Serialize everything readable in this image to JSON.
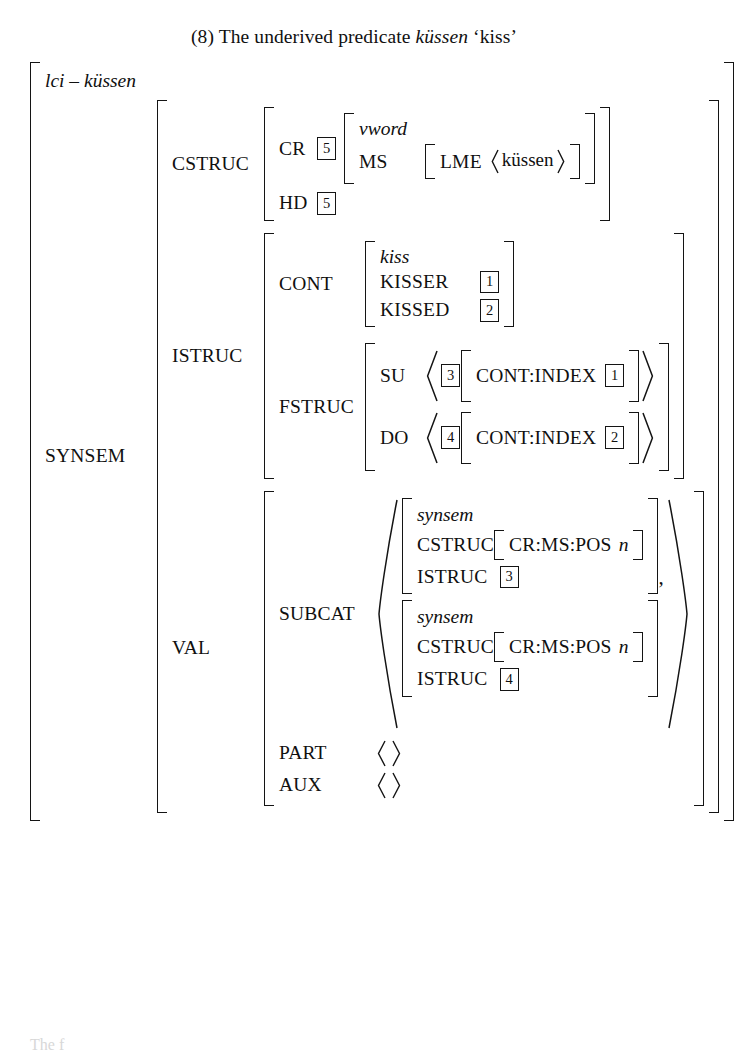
{
  "caption": {
    "number": "(8)",
    "text_before": "The underived predicate",
    "italic_word": "küssen",
    "gloss": "‘kiss’"
  },
  "avm": {
    "root_type": "lci – küssen",
    "synsem_label": "SYNSEM",
    "cstruc": {
      "label": "CSTRUC",
      "cr_label": "CR",
      "cr_tag": "5",
      "cr_value": {
        "type": "vword",
        "ms_label": "MS",
        "ms_value": {
          "lme_label": "LME",
          "lme_list": "küssen"
        }
      },
      "hd_label": "HD",
      "hd_tag": "5"
    },
    "istruc": {
      "label": "ISTRUC",
      "cont": {
        "label": "CONT",
        "type": "kiss",
        "rows": [
          {
            "attr": "KISSER",
            "tag": "1"
          },
          {
            "attr": "KISSED",
            "tag": "2"
          }
        ]
      },
      "fstruc": {
        "label": "FSTRUC",
        "rows": [
          {
            "attr": "SU",
            "tag": "3",
            "inner_attr": "CONT:INDEX",
            "inner_tag": "1"
          },
          {
            "attr": "DO",
            "tag": "4",
            "inner_attr": "CONT:INDEX",
            "inner_tag": "2"
          }
        ]
      }
    },
    "val": {
      "label": "VAL",
      "subcat": {
        "label": "SUBCAT",
        "separator": ",",
        "items": [
          {
            "type": "synsem",
            "cstruc_label": "CSTRUC",
            "cstruc_inner_attr": "CR:MS:POS",
            "cstruc_inner_val": "n",
            "istruc_label": "ISTRUC",
            "istruc_tag": "3"
          },
          {
            "type": "synsem",
            "cstruc_label": "CSTRUC",
            "cstruc_inner_attr": "CR:MS:POS",
            "cstruc_inner_val": "n",
            "istruc_label": "ISTRUC",
            "istruc_tag": "4"
          }
        ]
      },
      "part": {
        "label": "PART",
        "value": "empty-list"
      },
      "aux": {
        "label": "AUX",
        "value": "empty-list"
      }
    }
  },
  "footer_stub": "The f",
  "colors": {
    "ink": "#141414",
    "page": "#ffffff"
  }
}
